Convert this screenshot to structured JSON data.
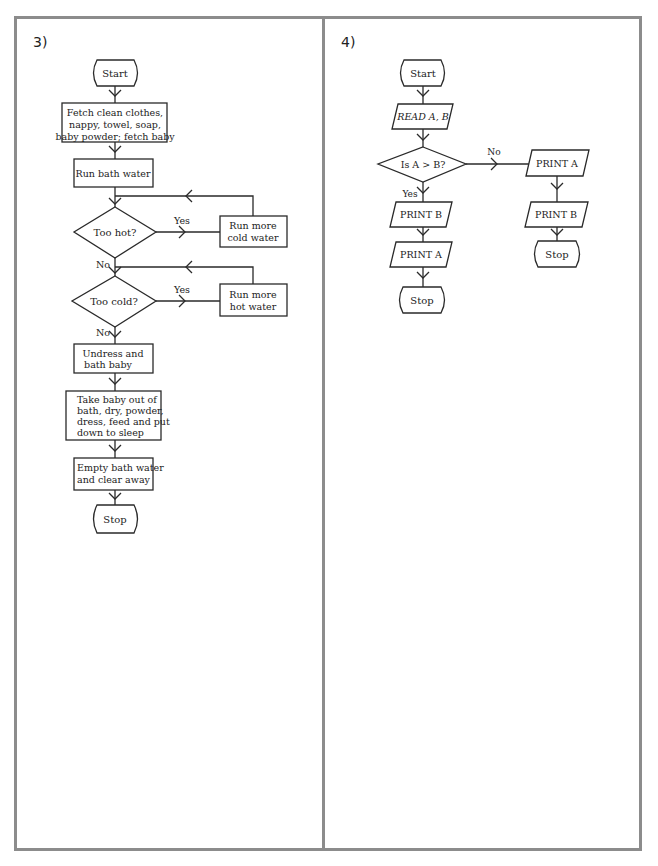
{
  "panels": [
    {
      "label": "3)",
      "nodes": {
        "start": "Start",
        "fetch": [
          "Fetch clean clothes,",
          "nappy, towel, soap,",
          "baby powder; fetch baby"
        ],
        "run_bath": [
          "Run bath water"
        ],
        "too_hot": "Too hot?",
        "run_cold": [
          "Run more",
          "cold water"
        ],
        "too_cold": "Too cold?",
        "run_hot": [
          "Run more",
          "hot water"
        ],
        "undress": [
          "Undress and",
          "bath baby"
        ],
        "take_out": [
          "Take baby out of",
          "bath, dry, powder,",
          "dress, feed and put",
          "down to sleep"
        ],
        "empty": [
          "Empty bath water",
          "and clear away"
        ],
        "stop": "Stop"
      },
      "edge_labels": {
        "too_hot_yes": "Yes",
        "too_hot_no": "No",
        "too_cold_yes": "Yes",
        "too_cold_no": "No"
      }
    },
    {
      "label": "4)",
      "nodes": {
        "start": "Start",
        "read": "READ A, B",
        "decision": "Is A > B?",
        "yes_print_b": "PRINT B",
        "yes_print_a": "PRINT A",
        "yes_stop": "Stop",
        "no_print_a": "PRINT A",
        "no_print_b": "PRINT B",
        "no_stop": "Stop"
      },
      "edge_labels": {
        "decision_no": "No",
        "decision_yes": "Yes"
      }
    }
  ]
}
